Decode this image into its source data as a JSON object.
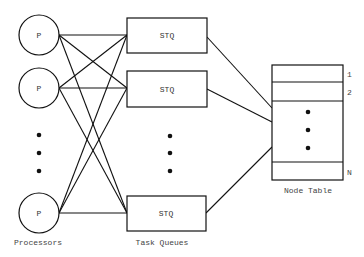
{
  "diagram": {
    "processors": {
      "label": "Processors",
      "node_label": "P",
      "nodes": [
        {
          "cx": 39,
          "cy": 35
        },
        {
          "cx": 39,
          "cy": 88
        },
        {
          "cx": 39,
          "cy": 213
        }
      ],
      "ellipsis_dots": [
        135,
        153,
        171
      ]
    },
    "task_queues": {
      "label": "Task Queues",
      "node_label": "STQ",
      "nodes": [
        {
          "y": 18,
          "h": 35
        },
        {
          "y": 71,
          "h": 36
        },
        {
          "y": 196,
          "h": 35
        }
      ],
      "ellipsis_dots": [
        136,
        153,
        171
      ]
    },
    "node_table": {
      "label": "Node Table",
      "row_labels": [
        "1",
        "2",
        "N"
      ],
      "ellipsis_dots": [
        112,
        130,
        148
      ]
    },
    "colors": {
      "stroke": "#111111",
      "text": "#444444",
      "background": "#ffffff"
    }
  }
}
